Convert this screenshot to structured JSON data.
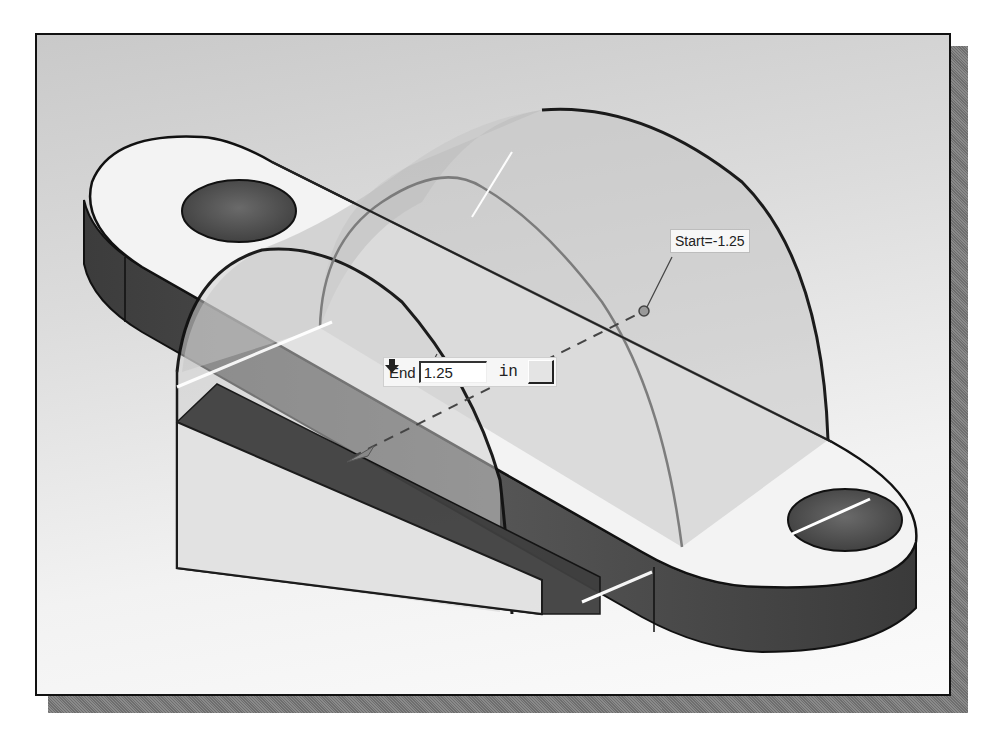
{
  "viewport": {
    "background_top": "#c9c9c9",
    "background_bottom": "#fbfbfb",
    "frame_color": "#111111"
  },
  "model": {
    "type": "extrude-preview",
    "description": "Base plate with two holes and semicircular extrusion preview"
  },
  "start_dimension": {
    "label": "Start=-1.25"
  },
  "end_dimension": {
    "label": "End",
    "value": "1.25",
    "unit": "in",
    "direction_icon": "down-arrow-icon"
  },
  "colors": {
    "plate_top": "#f3f3f3",
    "plate_side": "#4a4a4a",
    "hole": "#555555",
    "extrude_preview": "#b8b8b8",
    "edge": "#111111"
  }
}
